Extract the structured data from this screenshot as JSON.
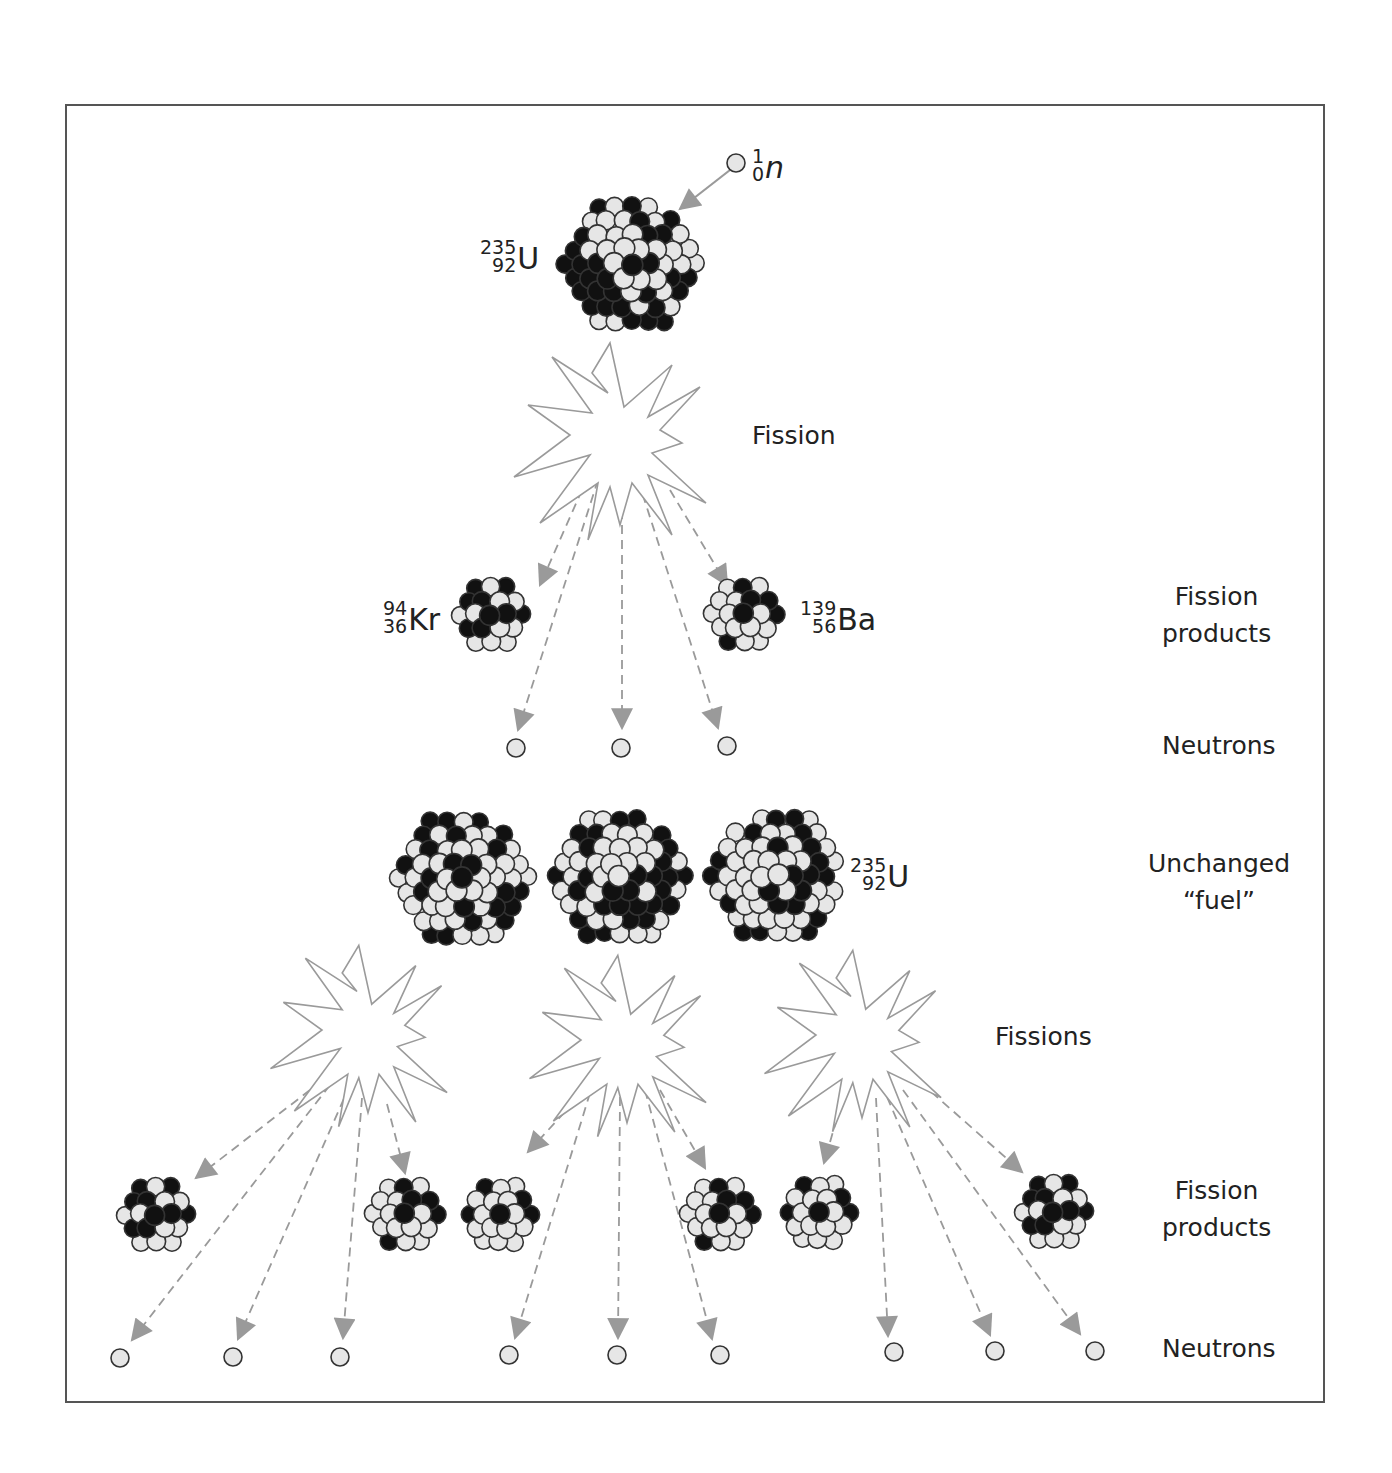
{
  "figure": {
    "colors": {
      "background": "#ffffff",
      "frame": "#555555",
      "text": "#222222",
      "proton": "#111111",
      "neutron_fill": "#e6e6e6",
      "outline": "#333333",
      "starburst_stroke": "#9a9a9a",
      "arrow": "#9a9a9a"
    }
  },
  "isotopes": {
    "incoming_neutron": {
      "mass": "1",
      "atomic": "0",
      "symbol": "n"
    },
    "uranium_top": {
      "mass": "235",
      "atomic": "92",
      "symbol": "U"
    },
    "krypton": {
      "mass": "94",
      "atomic": "36",
      "symbol": "Kr"
    },
    "barium": {
      "mass": "139",
      "atomic": "56",
      "symbol": "Ba"
    },
    "uranium_fuel": {
      "mass": "235",
      "atomic": "92",
      "symbol": "U"
    }
  },
  "stage_labels": {
    "fission": "Fission",
    "fission_products_1_line1": "Fission",
    "fission_products_1_line2": "products",
    "neutrons_1": "Neutrons",
    "unchanged_fuel_line1": "Unchanged",
    "unchanged_fuel_line2": "“fuel”",
    "fissions": "Fissions",
    "fission_products_2_line1": "Fission",
    "fission_products_2_line2": "products",
    "neutrons_2": "Neutrons"
  },
  "layout": {
    "incoming_neutron": {
      "x": 736,
      "y": 163,
      "r": 9
    },
    "large_nuclei": [
      {
        "id": "u235-initial",
        "x": 630,
        "y": 265,
        "r": 72,
        "seed": 3
      },
      {
        "id": "u235-fuel-1",
        "x": 462,
        "y": 879,
        "r": 72,
        "seed": 11
      },
      {
        "id": "u235-fuel-2",
        "x": 619,
        "y": 878,
        "r": 72,
        "seed": 17
      },
      {
        "id": "u235-fuel-3",
        "x": 776,
        "y": 877,
        "r": 72,
        "seed": 23
      }
    ],
    "small_nuclei": [
      {
        "id": "kr94",
        "x": 494,
        "y": 616,
        "r": 42,
        "seed": 5
      },
      {
        "id": "ba139",
        "x": 747,
        "y": 616,
        "r": 42,
        "seed": 7
      },
      {
        "id": "fp-1",
        "x": 159,
        "y": 1216,
        "r": 42,
        "seed": 5
      },
      {
        "id": "fp-2",
        "x": 408,
        "y": 1216,
        "r": 42,
        "seed": 7
      },
      {
        "id": "fp-3",
        "x": 503,
        "y": 1216,
        "r": 42,
        "seed": 9
      },
      {
        "id": "fp-4",
        "x": 723,
        "y": 1216,
        "r": 42,
        "seed": 7
      },
      {
        "id": "fp-5",
        "x": 822,
        "y": 1214,
        "r": 42,
        "seed": 9
      },
      {
        "id": "fp-6",
        "x": 1057,
        "y": 1213,
        "r": 42,
        "seed": 5
      }
    ],
    "neutrons": [
      {
        "x": 516,
        "y": 748
      },
      {
        "x": 621,
        "y": 748
      },
      {
        "x": 727,
        "y": 746
      },
      {
        "x": 120,
        "y": 1358
      },
      {
        "x": 233,
        "y": 1357
      },
      {
        "x": 340,
        "y": 1357
      },
      {
        "x": 509,
        "y": 1355
      },
      {
        "x": 617,
        "y": 1355
      },
      {
        "x": 720,
        "y": 1355
      },
      {
        "x": 894,
        "y": 1352
      },
      {
        "x": 995,
        "y": 1351
      },
      {
        "x": 1095,
        "y": 1351
      }
    ],
    "starbursts": [
      {
        "id": "fission-1",
        "x": 620,
        "y": 435,
        "scale": 1.0
      },
      {
        "id": "fission-2a",
        "x": 368,
        "y": 1030,
        "scale": 0.92
      },
      {
        "id": "fission-2b",
        "x": 627,
        "y": 1040,
        "scale": 0.92
      },
      {
        "id": "fission-2c",
        "x": 862,
        "y": 1035,
        "scale": 0.92
      }
    ],
    "arrows": [
      {
        "from": [
          730,
          170
        ],
        "to": [
          680,
          209
        ],
        "dashed": false
      },
      {
        "from": [
          582,
          490
        ],
        "to": [
          540,
          585
        ],
        "dashed": true
      },
      {
        "from": [
          670,
          490
        ],
        "to": [
          727,
          585
        ],
        "dashed": true
      },
      {
        "from": [
          598,
          480
        ],
        "to": [
          518,
          730
        ],
        "dashed": true
      },
      {
        "from": [
          622,
          480
        ],
        "to": [
          622,
          728
        ],
        "dashed": true
      },
      {
        "from": [
          638,
          480
        ],
        "to": [
          718,
          728
        ],
        "dashed": true
      },
      {
        "from": [
          310,
          1090
        ],
        "to": [
          196,
          1178
        ],
        "dashed": true
      },
      {
        "from": [
          330,
          1085
        ],
        "to": [
          132,
          1340
        ],
        "dashed": true
      },
      {
        "from": [
          350,
          1085
        ],
        "to": [
          238,
          1339
        ],
        "dashed": true
      },
      {
        "from": [
          362,
          1098
        ],
        "to": [
          343,
          1338
        ],
        "dashed": true
      },
      {
        "from": [
          387,
          1104
        ],
        "to": [
          405,
          1173
        ],
        "dashed": true
      },
      {
        "from": [
          585,
          1090
        ],
        "to": [
          528,
          1152
        ],
        "dashed": true
      },
      {
        "from": [
          590,
          1093
        ],
        "to": [
          515,
          1338
        ],
        "dashed": true
      },
      {
        "from": [
          620,
          1097
        ],
        "to": [
          618,
          1338
        ],
        "dashed": true
      },
      {
        "from": [
          645,
          1090
        ],
        "to": [
          712,
          1339
        ],
        "dashed": true
      },
      {
        "from": [
          660,
          1090
        ],
        "to": [
          705,
          1168
        ],
        "dashed": true
      },
      {
        "from": [
          845,
          1090
        ],
        "to": [
          824,
          1163
        ],
        "dashed": true
      },
      {
        "from": [
          876,
          1098
        ],
        "to": [
          888,
          1336
        ],
        "dashed": true
      },
      {
        "from": [
          887,
          1097
        ],
        "to": [
          990,
          1335
        ],
        "dashed": true
      },
      {
        "from": [
          903,
          1090
        ],
        "to": [
          1080,
          1334
        ],
        "dashed": true
      },
      {
        "from": [
          920,
          1082
        ],
        "to": [
          1022,
          1172
        ],
        "dashed": true
      }
    ]
  },
  "label_positions": {
    "uranium_top": {
      "x": 480,
      "y": 238
    },
    "incoming_neutron": {
      "x": 752,
      "y": 147
    },
    "krypton": {
      "x": 383,
      "y": 599
    },
    "barium": {
      "x": 800,
      "y": 599
    },
    "uranium_fuel": {
      "x": 850,
      "y": 856
    },
    "fission": {
      "x": 752,
      "y": 418
    },
    "fission_products_1": {
      "x": 1162,
      "y": 578
    },
    "neutrons_1": {
      "x": 1162,
      "y": 728
    },
    "unchanged_fuel": {
      "x": 1148,
      "y": 845
    },
    "fissions": {
      "x": 995,
      "y": 1019
    },
    "fission_products_2": {
      "x": 1162,
      "y": 1172
    },
    "neutrons_2": {
      "x": 1162,
      "y": 1331
    }
  }
}
